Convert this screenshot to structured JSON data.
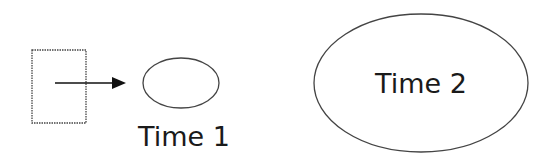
{
  "diagram": {
    "source_box": {
      "label": ""
    },
    "arrow": {
      "direction": "right"
    },
    "time1": {
      "label": "Time 1"
    },
    "time2": {
      "label": "Time 2"
    },
    "colors": {
      "stroke": "#333333",
      "text": "#1a1a1a",
      "background": "#ffffff"
    }
  }
}
